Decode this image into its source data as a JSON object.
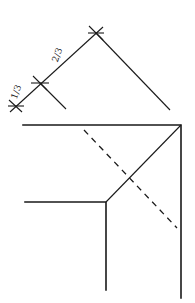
{
  "diagram": {
    "labels": {
      "upper_segment": "2/3",
      "lower_segment": "1/3"
    },
    "colors": {
      "stroke": "#1a1a1a",
      "background": "#ffffff"
    }
  }
}
